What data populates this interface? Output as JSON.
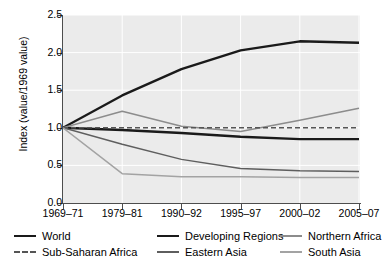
{
  "chart_data": {
    "type": "line",
    "title": "",
    "xlabel": "",
    "ylabel": "Index (value/1969 value)",
    "categories": [
      "1969–71",
      "1979–81",
      "1990–92",
      "1995–97",
      "2000–02",
      "2005–07"
    ],
    "ylim": [
      0.0,
      2.5
    ],
    "yticks": [
      "0.0",
      "0.5",
      "1.0",
      "1.5",
      "2.0",
      "2.5"
    ],
    "ytick_values": [
      0.0,
      0.5,
      1.0,
      1.5,
      2.0,
      2.5
    ],
    "grid": true,
    "legend_position": "bottom",
    "series": [
      {
        "name": "World",
        "values": [
          1.0,
          0.97,
          0.93,
          0.88,
          0.85,
          0.85
        ],
        "color": "#1a1a1a",
        "width": 2.4,
        "dash": "none"
      },
      {
        "name": "Developing Regions",
        "values": [
          1.0,
          1.43,
          1.78,
          2.03,
          2.15,
          2.13
        ],
        "color": "#1a1a1a",
        "width": 2.4,
        "dash": "none"
      },
      {
        "name": "Northern Africa",
        "values": [
          1.0,
          1.22,
          1.02,
          0.95,
          1.1,
          1.26
        ],
        "color": "#8c8c8c",
        "width": 1.5,
        "dash": "none"
      },
      {
        "name": "Sub-Saharan Africa",
        "values": [
          1.0,
          1.0,
          1.0,
          1.0,
          1.0,
          1.0
        ],
        "color": "#555555",
        "width": 1.6,
        "dash": "5,3"
      },
      {
        "name": "Eastern Asia",
        "values": [
          1.0,
          0.78,
          0.58,
          0.46,
          0.43,
          0.42
        ],
        "color": "#5e5e5e",
        "width": 1.5,
        "dash": "none"
      },
      {
        "name": "South Asia",
        "values": [
          1.0,
          0.39,
          0.35,
          0.35,
          0.34,
          0.34
        ],
        "color": "#a3a3a3",
        "width": 1.5,
        "dash": "none"
      }
    ]
  },
  "axis": {
    "y_title": "Index  (value/1969 value)"
  },
  "legend": {
    "entries": [
      {
        "label": "World"
      },
      {
        "label": "Developing Regions"
      },
      {
        "label": "Northern Africa"
      },
      {
        "label": "Sub-Saharan Africa"
      },
      {
        "label": "Eastern Asia"
      },
      {
        "label": "South Asia"
      }
    ]
  },
  "colors": {
    "plot_background": "#ebebeb",
    "grid": "#ffffff",
    "axis": "#4d4d4d",
    "page_background": "#ffffff"
  }
}
